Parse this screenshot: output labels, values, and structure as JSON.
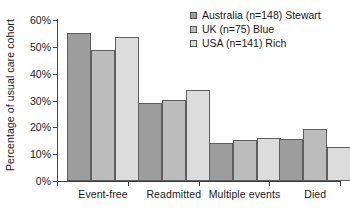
{
  "chart_data": {
    "type": "bar",
    "title": "",
    "xlabel": "",
    "ylabel": "Percentage of usual care cohort",
    "ylim": [
      0,
      60
    ],
    "ytick_labels": [
      "0%",
      "10%",
      "20%",
      "30%",
      "40%",
      "50%",
      "60%"
    ],
    "ytick_values": [
      0,
      10,
      20,
      30,
      40,
      50,
      60
    ],
    "grid": false,
    "legend_position": "top-right",
    "categories": [
      "Event-free",
      "Readmitted",
      "Multiple events",
      "Died"
    ],
    "series": [
      {
        "name": "Australia (n=148) Stewart",
        "color": "#9d9d9d",
        "values": [
          55.2,
          29.2,
          14.1,
          15.6
        ]
      },
      {
        "name": "UK (n=75) Blue",
        "color": "#bcbcbc",
        "values": [
          48.7,
          30.1,
          15.3,
          19.4
        ]
      },
      {
        "name": "USA (n=141) Rich",
        "color": "#dcdcdc",
        "values": [
          53.8,
          34.1,
          16.2,
          12.6
        ]
      }
    ]
  }
}
